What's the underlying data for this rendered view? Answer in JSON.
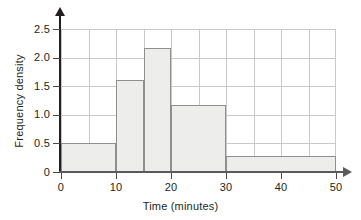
{
  "chart_data": {
    "type": "bar",
    "title": "",
    "subtitle": "",
    "xlabel": "Time (minutes)",
    "ylabel": "Frequency density",
    "xlim": [
      0,
      50
    ],
    "ylim": [
      0,
      2.5
    ],
    "grid": true,
    "legend": false,
    "x_ticks": [
      "0",
      "10",
      "20",
      "30",
      "40",
      "50"
    ],
    "x_tick_values": [
      0,
      10,
      20,
      30,
      40,
      50
    ],
    "y_ticks": [
      "0",
      "0.5",
      "1.0",
      "1.5",
      "2.0",
      "2.5"
    ],
    "y_tick_values": [
      0,
      0.5,
      1.0,
      1.5,
      2.0,
      2.5
    ],
    "bin_edges": [
      0,
      10,
      15,
      20,
      30,
      50
    ],
    "categories": [
      "0-10",
      "10-15",
      "15-20",
      "20-30",
      "30-50"
    ],
    "values": [
      0.5,
      1.6,
      2.175,
      1.175,
      0.275
    ],
    "bar_fill_color": "#ededec",
    "bar_edge_color": "#8f8f8f",
    "grid_color": "#c9c9c9",
    "axis_color": "#231f20"
  }
}
